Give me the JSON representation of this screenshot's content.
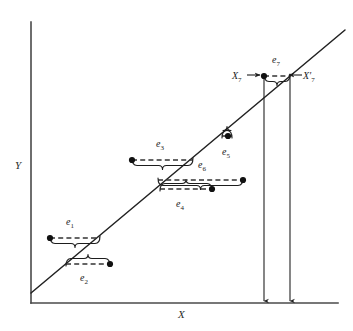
{
  "figure": {
    "type": "scatter-regression-residual-diagram",
    "axes": {
      "x_label": "X",
      "y_label": "Y",
      "x_axis": {
        "x1": 31,
        "y1": 303,
        "x2": 338,
        "y2": 303
      },
      "y_axis": {
        "x1": 31,
        "y1": 22,
        "x2": 31,
        "y2": 303
      }
    },
    "regression_line": {
      "x1": 31,
      "y1": 293,
      "x2": 345,
      "y2": 30
    },
    "point_labels": [
      {
        "id": "X7",
        "text": "X",
        "sub": "7",
        "x": 232,
        "y": 70,
        "arrow": "right"
      },
      {
        "id": "X7prime",
        "text": "X′",
        "sub": "7",
        "x": 303,
        "y": 70,
        "arrow": "left"
      }
    ],
    "residuals": [
      {
        "id": "e1",
        "label": "e",
        "sub": "1",
        "brace": "above",
        "dot_side": "left",
        "dot": {
          "x": 50,
          "y": 238
        },
        "line": {
          "x1": 50,
          "y1": 238,
          "x2": 100,
          "y2": 238
        },
        "label_pos": {
          "x": 66,
          "y": 216
        }
      },
      {
        "id": "e2",
        "label": "e",
        "sub": "2",
        "brace": "below",
        "dot_side": "right",
        "dot": {
          "x": 110,
          "y": 264
        },
        "line": {
          "x1": 66,
          "y1": 264,
          "x2": 110,
          "y2": 264
        },
        "label_pos": {
          "x": 80,
          "y": 272
        }
      },
      {
        "id": "e3",
        "label": "e",
        "sub": "3",
        "brace": "above",
        "dot_side": "left",
        "dot": {
          "x": 132,
          "y": 160
        },
        "line": {
          "x1": 132,
          "y1": 160,
          "x2": 193,
          "y2": 160
        },
        "label_pos": {
          "x": 156,
          "y": 138
        }
      },
      {
        "id": "e4",
        "label": "e",
        "sub": "4",
        "brace": "below",
        "dot_side": "right",
        "dot": {
          "x": 212,
          "y": 189
        },
        "line": {
          "x1": 160,
          "y1": 189,
          "x2": 212,
          "y2": 189
        },
        "label_pos": {
          "x": 176,
          "y": 198
        }
      },
      {
        "id": "e5",
        "label": "e",
        "sub": "5",
        "brace": "below",
        "dot_side": "none",
        "dot": {
          "x": 228,
          "y": 136
        },
        "line": {
          "x1": 222,
          "y1": 136,
          "x2": 232,
          "y2": 136
        },
        "label_pos": {
          "x": 222,
          "y": 146
        }
      },
      {
        "id": "e6",
        "label": "e",
        "sub": "6",
        "brace": "above",
        "dot_side": "right",
        "dot": {
          "x": 243,
          "y": 180
        },
        "line": {
          "x1": 158,
          "y1": 180,
          "x2": 243,
          "y2": 180
        },
        "label_pos": {
          "x": 198,
          "y": 159
        }
      },
      {
        "id": "e7",
        "label": "e",
        "sub": "7",
        "brace": "above",
        "dot_side": "left",
        "dot": {
          "x": 264,
          "y": 76
        },
        "line": {
          "x1": 264,
          "y1": 76,
          "x2": 290,
          "y2": 76
        },
        "label_pos": {
          "x": 272,
          "y": 54
        }
      }
    ],
    "drop_lines": [
      {
        "id": "drop-X7",
        "x": 264,
        "y1": 76,
        "y2": 301
      },
      {
        "id": "drop-X7prime",
        "x": 290,
        "y1": 76,
        "y2": 301
      }
    ],
    "colors": {
      "axis": "#4a4a4a",
      "line": "#222222",
      "dash": "#333333",
      "text": "#1d1d1d"
    }
  }
}
